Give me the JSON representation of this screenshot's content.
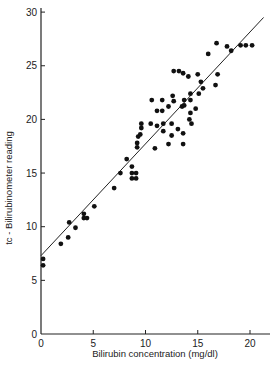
{
  "chart_data": {
    "type": "scatter",
    "title": "",
    "xlabel": "Bilirubin concentration (mg/dl)",
    "ylabel": "tc - Bilirubinometer reading",
    "xlim": [
      0,
      22
    ],
    "ylim": [
      0,
      30
    ],
    "xticks": [
      0,
      5,
      10,
      15,
      20
    ],
    "yticks": [
      0,
      5,
      10,
      15,
      20,
      25,
      30
    ],
    "grid": false,
    "legend": null,
    "regression_line": {
      "x": [
        0,
        21.3
      ],
      "y": [
        7.3,
        29.5
      ]
    },
    "points": [
      [
        0.2,
        7.0
      ],
      [
        0.2,
        6.4
      ],
      [
        1.9,
        8.4
      ],
      [
        2.6,
        9.0
      ],
      [
        2.7,
        10.4
      ],
      [
        3.3,
        9.9
      ],
      [
        4.1,
        11.2
      ],
      [
        4.1,
        10.8
      ],
      [
        4.4,
        10.8
      ],
      [
        5.1,
        11.9
      ],
      [
        7.0,
        13.6
      ],
      [
        7.6,
        15.0
      ],
      [
        8.2,
        16.3
      ],
      [
        8.7,
        15.6
      ],
      [
        8.7,
        15.0
      ],
      [
        8.7,
        14.5
      ],
      [
        9.1,
        15.0
      ],
      [
        9.1,
        14.5
      ],
      [
        9.2,
        17.8
      ],
      [
        9.2,
        17.4
      ],
      [
        9.3,
        18.4
      ],
      [
        9.5,
        18.6
      ],
      [
        9.6,
        19.6
      ],
      [
        9.6,
        19.2
      ],
      [
        10.5,
        19.6
      ],
      [
        10.6,
        21.8
      ],
      [
        10.9,
        17.3
      ],
      [
        11.1,
        20.8
      ],
      [
        11.1,
        19.4
      ],
      [
        11.6,
        21.8
      ],
      [
        11.6,
        20.8
      ],
      [
        11.7,
        19.6
      ],
      [
        11.7,
        18.9
      ],
      [
        12.2,
        21.2
      ],
      [
        12.2,
        17.7
      ],
      [
        12.5,
        19.6
      ],
      [
        12.5,
        18.5
      ],
      [
        12.6,
        22.2
      ],
      [
        12.7,
        21.7
      ],
      [
        12.7,
        24.5
      ],
      [
        13.1,
        19.1
      ],
      [
        13.2,
        24.5
      ],
      [
        13.5,
        21.2
      ],
      [
        13.6,
        18.7
      ],
      [
        13.6,
        17.7
      ],
      [
        13.6,
        24.3
      ],
      [
        13.7,
        21.8
      ],
      [
        13.7,
        21.3
      ],
      [
        14.1,
        24.0
      ],
      [
        14.2,
        20.0
      ],
      [
        14.3,
        21.8
      ],
      [
        14.3,
        20.6
      ],
      [
        14.3,
        22.4
      ],
      [
        14.4,
        19.6
      ],
      [
        14.8,
        21.0
      ],
      [
        15.0,
        24.2
      ],
      [
        15.1,
        22.4
      ],
      [
        15.3,
        23.5
      ],
      [
        15.5,
        22.9
      ],
      [
        16.0,
        26.1
      ],
      [
        16.7,
        23.2
      ],
      [
        16.9,
        24.2
      ],
      [
        16.8,
        27.1
      ],
      [
        17.8,
        26.8
      ],
      [
        18.2,
        26.4
      ],
      [
        19.1,
        26.9
      ],
      [
        19.6,
        26.9
      ],
      [
        20.2,
        26.9
      ]
    ]
  },
  "axes": {
    "x_label": "Bilirubin concentration (mg/dl)",
    "y_label": "tc - Bilirubinometer reading",
    "x_ticks": [
      "0",
      "5",
      "10",
      "15",
      "20"
    ],
    "y_ticks": [
      "0",
      "5",
      "10",
      "15",
      "20",
      "25",
      "30"
    ]
  }
}
